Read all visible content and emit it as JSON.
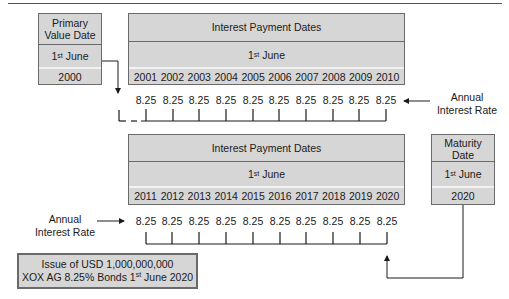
{
  "primary_value": {
    "title": "Primary Value Date",
    "day": "1",
    "day_sup": "st",
    "month": "June",
    "year": "2000"
  },
  "top_schedule": {
    "title": "Interest Payment Dates",
    "day": "1",
    "day_sup": "st",
    "month": "June",
    "years": [
      "2001",
      "2002",
      "2003",
      "2004",
      "2005",
      "2006",
      "2007",
      "2008",
      "2009",
      "2010"
    ],
    "rates": [
      "8.25",
      "8.25",
      "8.25",
      "8.25",
      "8.25",
      "8.25",
      "8.25",
      "8.25",
      "8.25",
      "8.25"
    ],
    "rate_label": "Annual Interest Rate"
  },
  "bottom_schedule": {
    "title": "Interest Payment Dates",
    "day": "1",
    "day_sup": "st",
    "month": "June",
    "years": [
      "2011",
      "2012",
      "2013",
      "2014",
      "2015",
      "2016",
      "2017",
      "2018",
      "2019",
      "2020"
    ],
    "rates": [
      "8.25",
      "8.25",
      "8.25",
      "8.25",
      "8.25",
      "8.25",
      "8.25",
      "8.25",
      "8.25",
      "8.25"
    ],
    "rate_label": "Annual Interest Rate"
  },
  "maturity": {
    "title": "Maturity Date",
    "day": "1",
    "day_sup": "st",
    "month": "June",
    "year": "2020"
  },
  "issue": {
    "line1": "Issue of USD 1,000,000,000",
    "line2_prefix": "XOX AG 8.25% Bonds 1",
    "line2_sup": "st",
    "line2_suffix": "June 2020"
  }
}
